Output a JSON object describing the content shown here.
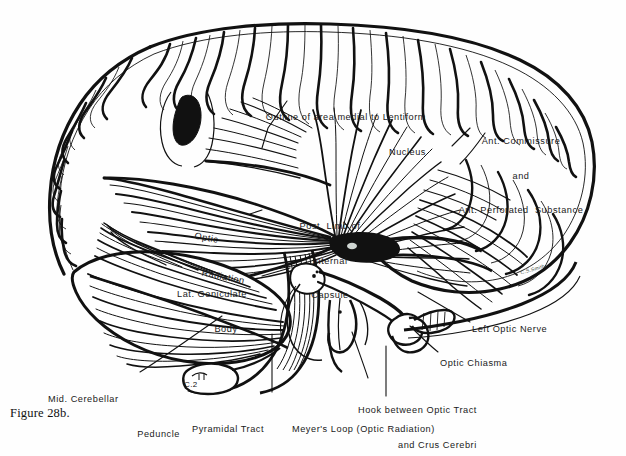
{
  "figure": {
    "caption": "Figure 28b.",
    "signature": "C.S.Smith",
    "ink_color": "#111111",
    "paper_color": "#fefefe"
  },
  "labels": {
    "lentiform": {
      "line1": "Outline of area medial to Lentiform",
      "line2": "Nucleus"
    },
    "ant_commissure": {
      "line1": "Ant. Commissure",
      "line2": "and",
      "line3": "Ant. Perforated  Substance"
    },
    "optic_radiation": {
      "line1": "Optic",
      "line2": "Radiation"
    },
    "internal_capsule": {
      "line1": "Post. Limb of",
      "line2": "Internal",
      "line3": "Capsule"
    },
    "lat_geniculate": {
      "line1": "Lat. Geniculate",
      "line2": "Body"
    },
    "mid_cerebellar": {
      "line1": "Mid. Cerebellar",
      "line2": "Peduncle"
    },
    "left_optic_nerve": {
      "line1": "Left Optic Nerve"
    },
    "optic_chiasma": {
      "line1": "Optic Chiasma"
    },
    "hook": {
      "line1": "Hook between Optic Tract",
      "line2": "and Crus Cerebri"
    },
    "pyramidal": {
      "line1": "Pyramidal Tract"
    },
    "meyers_loop": {
      "line1": "Meyer's Loop (Optic Radiation)"
    },
    "cord_level": {
      "line1": "C.2"
    }
  }
}
